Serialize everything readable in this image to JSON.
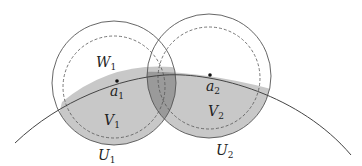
{
  "diagram": {
    "colors": {
      "stroke": "#555555",
      "shade_light": "#c8c8c8",
      "shade_dark": "#9a9a9a",
      "background": "#ffffff"
    },
    "labels": {
      "W1": {
        "base": "W",
        "sub": "1"
      },
      "a1": {
        "base": "a",
        "sub": "1"
      },
      "V1": {
        "base": "V",
        "sub": "1"
      },
      "U1": {
        "base": "U",
        "sub": "1"
      },
      "a2": {
        "base": "a",
        "sub": "2"
      },
      "V2": {
        "base": "V",
        "sub": "2"
      },
      "U2": {
        "base": "U",
        "sub": "2"
      }
    },
    "points": [
      "a1",
      "a2"
    ],
    "circles": [
      "U1 (solid)",
      "W1 (dashed)",
      "U2 (solid)",
      "W2 (dashed)"
    ],
    "curve": "arc through a1 and a2",
    "shaded_regions": [
      "V1",
      "V2",
      "V1 ∩ V2 overlap (darker)"
    ]
  }
}
